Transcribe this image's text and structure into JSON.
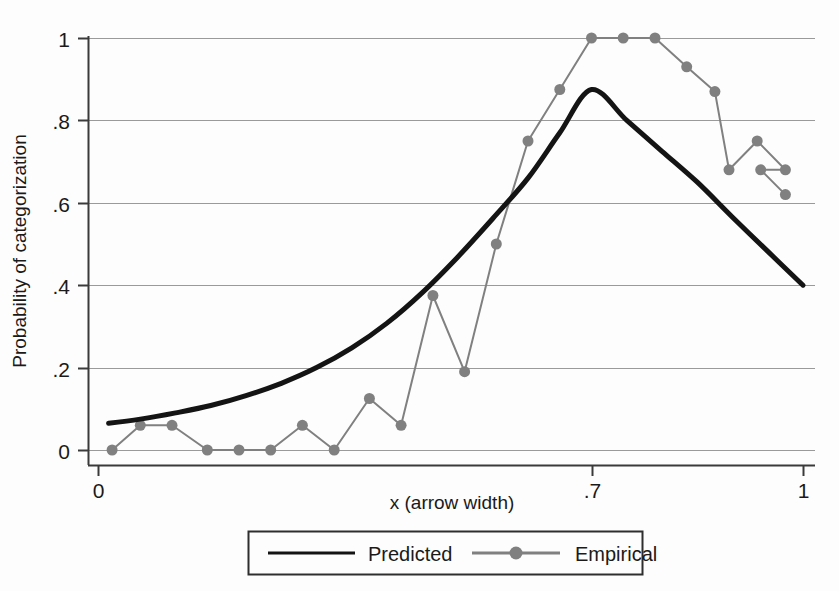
{
  "chart_data": {
    "type": "line",
    "title": "",
    "subtitle": "",
    "xlabel": "x (arrow width)",
    "ylabel": "Probability of categorization",
    "xlim": [
      0,
      1
    ],
    "ylim": [
      0,
      1
    ],
    "xticks": [
      0,
      0.7,
      1
    ],
    "xtick_labels": [
      "0",
      ".7",
      "1"
    ],
    "yticks": [
      0,
      0.2,
      0.4,
      0.6,
      0.8,
      1
    ],
    "ytick_labels": [
      "0",
      ".2",
      ".4",
      ".6",
      ".8",
      "1"
    ],
    "grid": true,
    "grid_axis": "y",
    "legend_position": "bottom-center",
    "series": [
      {
        "name": "Predicted",
        "style": "line",
        "color": "#141414",
        "width": 5,
        "marker": "none",
        "x": [
          0.015,
          0.06,
          0.11,
          0.16,
          0.21,
          0.26,
          0.31,
          0.36,
          0.41,
          0.46,
          0.51,
          0.56,
          0.61,
          0.655,
          0.7,
          0.75,
          0.8,
          0.85,
          0.9,
          0.95,
          1.0
        ],
        "values": [
          0.065,
          0.075,
          0.09,
          0.108,
          0.132,
          0.162,
          0.2,
          0.248,
          0.308,
          0.382,
          0.468,
          0.562,
          0.66,
          0.77,
          0.875,
          0.8,
          0.725,
          0.65,
          0.565,
          0.482,
          0.4
        ]
      },
      {
        "name": "Empirical",
        "style": "line-marker",
        "color": "#808080",
        "width": 2,
        "marker": "circle",
        "marker_size": 11,
        "x": [
          0.02,
          0.06,
          0.105,
          0.155,
          0.2,
          0.245,
          0.29,
          0.335,
          0.385,
          0.43,
          0.475,
          0.52,
          0.565,
          0.61,
          0.655,
          0.7,
          0.745,
          0.79,
          0.835,
          0.875,
          0.895,
          0.935,
          0.975
        ],
        "values": [
          0.0,
          0.06,
          0.06,
          0.0,
          0.0,
          0.0,
          0.06,
          0.0,
          0.125,
          0.06,
          0.375,
          0.19,
          0.5,
          0.75,
          0.875,
          1.0,
          1.0,
          1.0,
          0.93,
          0.87,
          0.68,
          0.75,
          0.68
        ]
      }
    ],
    "empirical_extra_points": {
      "x": [
        0.94,
        0.975
      ],
      "values": [
        0.68,
        0.62
      ]
    }
  },
  "legend": {
    "entries": [
      {
        "label": "Predicted",
        "color": "#141414",
        "marker": false
      },
      {
        "label": "Empirical",
        "color": "#808080",
        "marker": true
      }
    ]
  },
  "axes": {
    "y_title": "Probability of categorization",
    "x_title": "x (arrow width)"
  }
}
